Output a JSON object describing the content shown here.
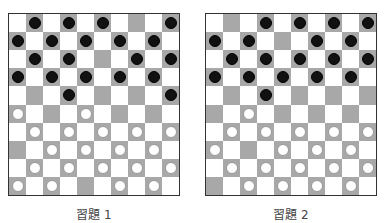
{
  "colors": {
    "dark_square": "#a8a8a8",
    "light_square": "#ffffff",
    "black_piece": "#111111",
    "white_piece": "#ffffff"
  },
  "boards": [
    {
      "label": "習題 1",
      "rows": [
        "..B.B.B...B",
        "",
        "",
        "",
        "",
        "",
        "",
        "",
        "",
        ""
      ],
      "pieces": [
        [
          ".",
          "B",
          ".",
          "B",
          ".",
          "B",
          ".",
          ".",
          ".",
          "B"
        ],
        [
          "B",
          ".",
          "B",
          ".",
          "B",
          ".",
          "B",
          ".",
          "B",
          "."
        ],
        [
          ".",
          "B",
          ".",
          "B",
          ".",
          ".",
          ".",
          "B",
          ".",
          "B"
        ],
        [
          "B",
          ".",
          "B",
          ".",
          "B",
          ".",
          "B",
          ".",
          "B",
          "."
        ],
        [
          ".",
          ".",
          ".",
          "B",
          ".",
          ".",
          ".",
          ".",
          ".",
          "B"
        ],
        [
          "W",
          ".",
          ".",
          ".",
          "W",
          ".",
          ".",
          ".",
          ".",
          "."
        ],
        [
          ".",
          "W",
          ".",
          "W",
          ".",
          "W",
          ".",
          "W",
          ".",
          "W"
        ],
        [
          ".",
          ".",
          "W",
          ".",
          "W",
          ".",
          "W",
          ".",
          "W",
          "."
        ],
        [
          ".",
          "W",
          ".",
          "W",
          ".",
          "W",
          ".",
          "W",
          ".",
          "W"
        ],
        [
          "W",
          ".",
          "W",
          ".",
          ".",
          ".",
          "W",
          ".",
          "W",
          "."
        ]
      ]
    },
    {
      "label": "習題 2",
      "pieces": [
        [
          ".",
          ".",
          ".",
          "B",
          ".",
          "B",
          ".",
          "B",
          ".",
          "B"
        ],
        [
          "B",
          ".",
          "B",
          ".",
          ".",
          ".",
          "B",
          ".",
          "B",
          "."
        ],
        [
          ".",
          "B",
          ".",
          "B",
          ".",
          "B",
          ".",
          "B",
          ".",
          "B"
        ],
        [
          "B",
          ".",
          "B",
          ".",
          "B",
          ".",
          "B",
          ".",
          "B",
          "."
        ],
        [
          ".",
          ".",
          ".",
          "B",
          ".",
          ".",
          ".",
          ".",
          ".",
          "."
        ],
        [
          ".",
          ".",
          "W",
          ".",
          ".",
          ".",
          ".",
          ".",
          ".",
          "."
        ],
        [
          ".",
          "W",
          ".",
          "W",
          ".",
          "W",
          ".",
          "W",
          ".",
          "W"
        ],
        [
          "W",
          ".",
          ".",
          ".",
          "W",
          ".",
          "W",
          ".",
          "W",
          "."
        ],
        [
          ".",
          "W",
          ".",
          "W",
          ".",
          "W",
          ".",
          "W",
          ".",
          "W"
        ],
        [
          ".",
          ".",
          "W",
          ".",
          "W",
          ".",
          "W",
          ".",
          "W",
          "."
        ]
      ]
    }
  ]
}
